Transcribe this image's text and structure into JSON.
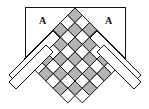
{
  "diagram": {
    "labels": [
      {
        "id": "left",
        "text": "A"
      },
      {
        "id": "right",
        "text": "A"
      }
    ],
    "colors": {
      "shaded": "#b3b3b3",
      "blank": "#ffffff",
      "stroke": "#111111"
    }
  }
}
